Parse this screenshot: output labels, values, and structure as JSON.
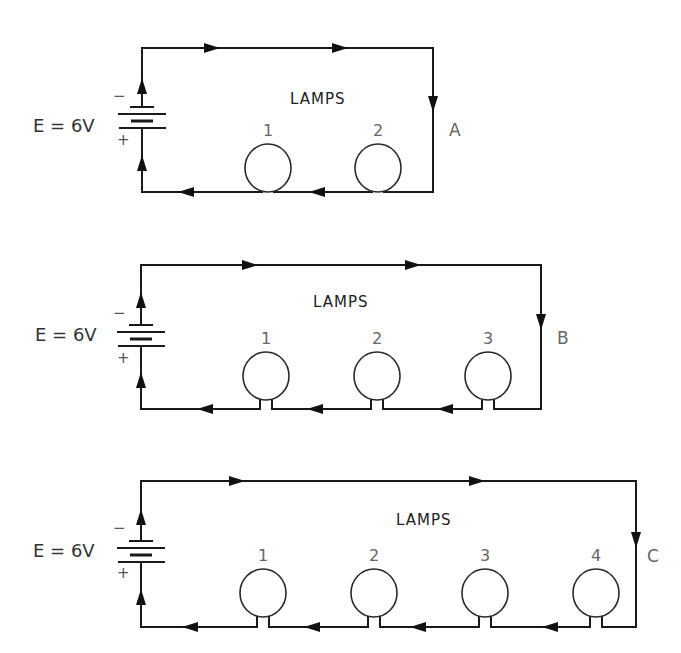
{
  "figure": {
    "colors": {
      "wire": "#1a1a1a",
      "text": "#444444",
      "background": "#ffffff"
    }
  },
  "circuits": [
    {
      "id": "A",
      "emf_label": "E = 6V",
      "negative_label": "−",
      "positive_label": "+",
      "lamps_title": "LAMPS",
      "frame": {
        "left": 142,
        "top": 48,
        "right": 433,
        "bottom": 192
      },
      "battery": {
        "plates_y": [
          107,
          114,
          121,
          128
        ],
        "emf_x": 33,
        "emf_y": 132,
        "neg_pos": [
          113,
          101
        ],
        "pos_pos": [
          117,
          145
        ]
      },
      "lamps_title_pos": [
        290,
        104
      ],
      "id_pos": [
        449,
        136
      ],
      "lamps": [
        {
          "number": "1",
          "cx": 268,
          "cy": 168
        },
        {
          "number": "2",
          "cx": 378,
          "cy": 168
        }
      ],
      "arrows_top": [
        212,
        340
      ],
      "arrows_bottom": [
        186,
        317
      ],
      "arrow_right_y": 104,
      "arrows_left_y": [
        86,
        163
      ]
    },
    {
      "id": "B",
      "emf_label": "E = 6V",
      "negative_label": "−",
      "positive_label": "+",
      "lamps_title": "LAMPS",
      "frame": {
        "left": 141,
        "top": 265,
        "right": 541,
        "bottom": 409
      },
      "battery": {
        "plates_y": [
          325,
          332,
          339,
          346
        ],
        "emf_x": 35,
        "emf_y": 341,
        "neg_pos": [
          113,
          318
        ],
        "pos_pos": [
          117,
          363
        ]
      },
      "lamps_title_pos": [
        313,
        307
      ],
      "id_pos": [
        557,
        344
      ],
      "lamps": [
        {
          "number": "1",
          "cx": 266,
          "cy": 376
        },
        {
          "number": "2",
          "cx": 377,
          "cy": 376
        },
        {
          "number": "3",
          "cx": 488,
          "cy": 376
        }
      ],
      "arrows_top": [
        250,
        413
      ],
      "arrows_bottom": [
        205,
        315,
        445
      ],
      "arrow_right_y": 322,
      "arrows_left_y": [
        300,
        380
      ]
    },
    {
      "id": "C",
      "emf_label": "E = 6V",
      "negative_label": "−",
      "positive_label": "+",
      "lamps_title": "LAMPS",
      "frame": {
        "left": 141,
        "top": 481,
        "right": 636,
        "bottom": 627
      },
      "battery": {
        "plates_y": [
          541,
          548,
          555,
          562
        ],
        "emf_x": 33,
        "emf_y": 557,
        "neg_pos": [
          113,
          533
        ],
        "pos_pos": [
          117,
          578
        ]
      },
      "lamps_title_pos": [
        396,
        525
      ],
      "id_pos": [
        647,
        562
      ],
      "lamps": [
        {
          "number": "1",
          "cx": 263,
          "cy": 593
        },
        {
          "number": "2",
          "cx": 374,
          "cy": 593
        },
        {
          "number": "3",
          "cx": 485,
          "cy": 593
        },
        {
          "number": "4",
          "cx": 596,
          "cy": 593
        }
      ],
      "arrows_top": [
        237,
        477
      ],
      "arrows_bottom": [
        190,
        312,
        418,
        550
      ],
      "arrow_right_y": 540,
      "arrows_left_y": [
        517,
        597
      ]
    }
  ]
}
